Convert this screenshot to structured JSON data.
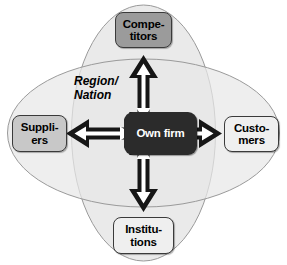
{
  "diagram": {
    "type": "network-relationship-diagram",
    "center": {
      "id": "own-firm",
      "label": "Own firm",
      "fill": "#2b2b2b",
      "text_color": "#ffffff"
    },
    "context_label": {
      "line1": "Region/",
      "line2": "Nation",
      "style": "bold-italic"
    },
    "nodes": [
      {
        "id": "competitors",
        "line1": "Compe-",
        "line2": "titors",
        "position": "top",
        "fill": "#9b9b9b"
      },
      {
        "id": "suppliers",
        "line1": "Suppli-",
        "line2": "ers",
        "position": "left",
        "fill": "#c8c8c8"
      },
      {
        "id": "customers",
        "line1": "Custo-",
        "line2": "mers",
        "position": "right",
        "fill": "#efefef"
      },
      {
        "id": "institutions",
        "line1": "Institu-",
        "line2": "tions",
        "position": "bottom",
        "fill": "#efefef"
      }
    ],
    "arrows": [
      {
        "id": "arrow-up",
        "direction": "vertical-up",
        "style": "double-headed",
        "fill": "#161616",
        "inner": "#ffffff"
      },
      {
        "id": "arrow-down",
        "direction": "vertical-down",
        "style": "double-headed",
        "fill": "#161616",
        "inner": "#ffffff"
      },
      {
        "id": "arrow-left",
        "direction": "horizontal-left",
        "style": "double-headed",
        "fill": "#161616",
        "inner": "#ffffff"
      },
      {
        "id": "arrow-right",
        "direction": "horizontal-right",
        "style": "double-headed",
        "fill": "#161616",
        "inner": "#ffffff"
      }
    ],
    "ellipses": [
      {
        "id": "vertical-ellipse",
        "orientation": "vertical",
        "fill": "#e8e8e8",
        "stroke": "#9a9a9a"
      },
      {
        "id": "horizontal-ellipse",
        "orientation": "horizontal",
        "fill": "#e8e8e8",
        "stroke": "#9a9a9a"
      }
    ],
    "colors": {
      "background": "#ffffff",
      "ellipse_fill": "#e8e8e8",
      "ellipse_stroke": "#9a9a9a",
      "arrow_fill": "#161616",
      "arrow_inner": "#ffffff"
    }
  }
}
